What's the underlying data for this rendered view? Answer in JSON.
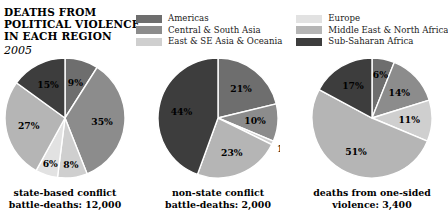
{
  "title": {
    "line1": "DEATHS FROM",
    "line2": "POLITICAL VIOLENCE",
    "line3": "IN EACH REGION",
    "year": "2005"
  },
  "legend": {
    "column_left": [
      {
        "label": "Americas",
        "color": "#6e6e6e",
        "key": "americas"
      },
      {
        "label": "Central & South Asia",
        "color": "#8c8c8c",
        "key": "central-south-asia"
      },
      {
        "label": "East & SE Asia & Oceania",
        "color": "#cfcfcf",
        "key": "east-se-asia-oceania"
      }
    ],
    "column_right": [
      {
        "label": "Europe",
        "color": "#e2e2e2",
        "key": "europe"
      },
      {
        "label": "Middle East & North Africa",
        "color": "#b5b5b5",
        "key": "middle-east-north-africa"
      },
      {
        "label": "Sub-Saharan Africa",
        "color": "#3d3d3d",
        "key": "sub-saharan-africa"
      }
    ]
  },
  "chart_data": {
    "type": "pie",
    "title": "DEATHS FROM POLITICAL VIOLENCE IN EACH REGION",
    "subtitle": "2005",
    "legend_position": "top",
    "units": "percent",
    "categories": [
      "Americas",
      "Central & South Asia",
      "East & SE Asia & Oceania",
      "Europe",
      "Middle East & North Africa",
      "Sub-Saharan Africa"
    ],
    "category_colors": {
      "Americas": "#6e6e6e",
      "Central & South Asia": "#8c8c8c",
      "East & SE Asia & Oceania": "#cfcfcf",
      "Europe": "#e2e2e2",
      "Middle East & North Africa": "#b5b5b5",
      "Sub-Saharan Africa": "#3d3d3d"
    },
    "charts": [
      {
        "id": "state-based-conflict",
        "caption_line1": "state-based conflict",
        "caption_line2": "battle-deaths: 12,000",
        "total_deaths": 12000,
        "slices": [
          {
            "category": "Americas",
            "value": 9,
            "label": "9%"
          },
          {
            "category": "Central & South Asia",
            "value": 35,
            "label": "35%"
          },
          {
            "category": "East & SE Asia & Oceania",
            "value": 8,
            "label": "8%"
          },
          {
            "category": "Europe",
            "value": 6,
            "label": "6%"
          },
          {
            "category": "Middle East & North Africa",
            "value": 27,
            "label": "27%"
          },
          {
            "category": "Sub-Saharan Africa",
            "value": 15,
            "label": "15%"
          }
        ]
      },
      {
        "id": "non-state-conflict",
        "caption_line1": "non-state conflict",
        "caption_line2": "battle-deaths: 2,000",
        "total_deaths": 2000,
        "slices": [
          {
            "category": "Americas",
            "value": 21,
            "label": "21%"
          },
          {
            "category": "Central & South Asia",
            "value": 10,
            "label": "10%"
          },
          {
            "category": "East & SE Asia & Oceania",
            "value": 1,
            "label": "1%"
          },
          {
            "category": "Middle East & North Africa",
            "value": 23,
            "label": "23%"
          },
          {
            "category": "Sub-Saharan Africa",
            "value": 44,
            "label": "44%"
          }
        ]
      },
      {
        "id": "one-sided-violence",
        "caption_line1": "deaths from one-sided",
        "caption_line2": "violence: 3,400",
        "total_deaths": 3400,
        "slices": [
          {
            "category": "Americas",
            "value": 6,
            "label": "6%"
          },
          {
            "category": "Central & South Asia",
            "value": 14,
            "label": "14%"
          },
          {
            "category": "East & SE Asia & Oceania",
            "value": 11,
            "label": "11%"
          },
          {
            "category": "Middle East & North Africa",
            "value": 51,
            "label": "51%"
          },
          {
            "category": "Sub-Saharan Africa",
            "value": 17,
            "label": "17%"
          }
        ]
      }
    ]
  }
}
